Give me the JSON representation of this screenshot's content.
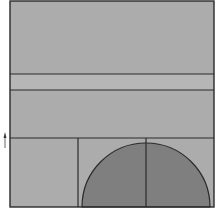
{
  "diagram": {
    "colors": {
      "background": "#ffffff",
      "fill_light": "#acacac",
      "fill_band": "#b6b6b6",
      "fill_semicircle": "#7f7f7f",
      "stroke": "#2a2a2a",
      "marker": "#3a3a3a"
    },
    "outer_box": {
      "x": 10,
      "y": 1,
      "width": 204,
      "height": 206
    },
    "horizontal_lines_y": [
      74,
      90,
      138
    ],
    "vertical_lines": [
      {
        "x": 78,
        "y1": 138,
        "y2": 207
      },
      {
        "x": 146,
        "y1": 138,
        "y2": 207
      }
    ],
    "semicircle": {
      "cx": 146,
      "cy": 207,
      "r": 64
    },
    "marker": {
      "x": 5,
      "y": 133,
      "label": "small arrow tick"
    }
  }
}
